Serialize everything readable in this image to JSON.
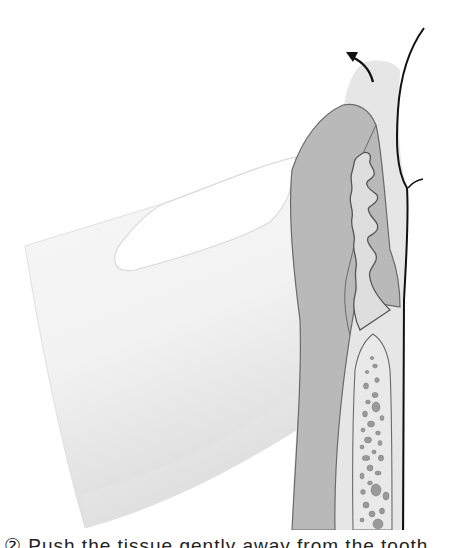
{
  "figure": {
    "elements": [
      {
        "name": "finger",
        "label": "fingertip"
      },
      {
        "name": "fingernail",
        "label": "fingernail"
      },
      {
        "name": "gingiva-outer",
        "label": "gingival soft tissue"
      },
      {
        "name": "tooth-dentin",
        "label": "tooth / cementum layer"
      },
      {
        "name": "pulp-canal",
        "label": "root canal"
      },
      {
        "name": "alveolar-bone",
        "label": "alveolar bone"
      },
      {
        "name": "direction-arrow",
        "label": "direction of retraction"
      }
    ],
    "colors": {
      "outline": "#111111",
      "dark_tissue": "#b9b9b9",
      "light_tissue": "#e6e6e6",
      "finger": "#f3f3f3",
      "bone_pores": "#8a8a8a"
    }
  },
  "caption": {
    "text": "② Push the tissue gently away from the tooth"
  }
}
